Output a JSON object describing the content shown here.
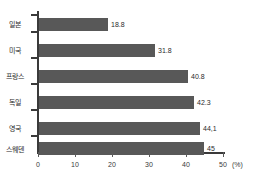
{
  "chart_data": {
    "type": "bar",
    "orientation": "horizontal",
    "title": "",
    "xlabel": "(%)",
    "ylabel": "",
    "categories": [
      "일본",
      "미국",
      "프랑스",
      "독일",
      "영국",
      "스웨덴"
    ],
    "values": [
      18.8,
      31.8,
      40.8,
      42.3,
      44.1,
      45
    ],
    "value_labels": [
      "18.8",
      "31.8",
      "40.8",
      "42.3",
      "44,1",
      "45"
    ],
    "xlim": [
      0,
      50
    ],
    "xticks": [
      0,
      10,
      20,
      30,
      40,
      50
    ],
    "xtick_labels": [
      "0",
      "10",
      "20",
      "30",
      "40",
      "50"
    ],
    "grid": false,
    "legend": false,
    "bar_color": "#585858",
    "axis_color": "#3a3a3a",
    "background": "#ffffff"
  }
}
